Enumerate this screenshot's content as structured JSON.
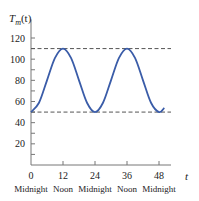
{
  "chart_data": {
    "type": "line",
    "title": "",
    "ylabel_main": "T",
    "ylabel_sub": "m",
    "ylabel_arg": "(t)",
    "xlabel": "t",
    "xlim": [
      0,
      54
    ],
    "ylim": [
      0,
      130
    ],
    "x_ticks": [
      0,
      12,
      24,
      36,
      48
    ],
    "x_tick_labels": [
      "0",
      "12",
      "24",
      "36",
      "48"
    ],
    "x_tick_sublabels": [
      "Midnight",
      "Noon",
      "Midnight",
      "Noon",
      "Midnight"
    ],
    "y_ticks": [
      0,
      10,
      20,
      30,
      40,
      50,
      60,
      70,
      80,
      90,
      100,
      110,
      120
    ],
    "y_tick_labels": [
      {
        "value": 20,
        "label": "20"
      },
      {
        "value": 40,
        "label": "40"
      },
      {
        "value": 60,
        "label": "60"
      },
      {
        "value": 80,
        "label": "80"
      },
      {
        "value": 100,
        "label": "100"
      },
      {
        "value": 120,
        "label": "120"
      }
    ],
    "series": [
      {
        "name": "T_m(t) = 80 - 30 cos(pi t / 12)",
        "color": "#3a5ca8",
        "x": [
          0,
          3,
          6,
          9,
          12,
          15,
          18,
          21,
          24,
          27,
          30,
          33,
          36,
          39,
          42,
          45,
          48,
          50
        ],
        "y": [
          50,
          58.8,
          80,
          101.2,
          110,
          101.2,
          80,
          58.8,
          50,
          58.8,
          80,
          101.2,
          110,
          101.2,
          80,
          58.8,
          50,
          54
        ]
      }
    ],
    "reference_lines": [
      {
        "y": 110,
        "style": "dashed",
        "color": "#555555",
        "x_end": 52.5
      },
      {
        "y": 50,
        "style": "dashed",
        "color": "#555555",
        "x_end": 52.5
      }
    ],
    "grid": false,
    "legend": "none"
  }
}
